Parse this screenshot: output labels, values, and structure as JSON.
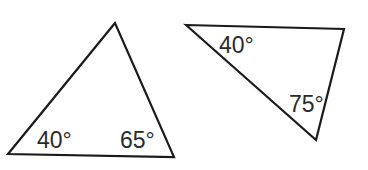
{
  "figure": {
    "stroke_color": "#1a1a1a",
    "label_color": "#2a2a2a"
  },
  "triangles": [
    {
      "id": "left",
      "vertices": [
        [
          115,
          23
        ],
        [
          8,
          154
        ],
        [
          174,
          157
        ]
      ],
      "angles": [
        {
          "label": "40°",
          "value": 40,
          "at_vertex": "bottom-left",
          "x": 37,
          "y": 148
        },
        {
          "label": "65°",
          "value": 65,
          "at_vertex": "bottom-right",
          "x": 120,
          "y": 148
        }
      ]
    },
    {
      "id": "right",
      "vertices": [
        [
          186,
          25
        ],
        [
          344,
          29
        ],
        [
          316,
          140
        ]
      ],
      "angles": [
        {
          "label": "40°",
          "value": 40,
          "at_vertex": "top-left",
          "x": 219,
          "y": 53
        },
        {
          "label": "75°",
          "value": 75,
          "at_vertex": "bottom",
          "x": 289,
          "y": 112
        }
      ]
    }
  ]
}
